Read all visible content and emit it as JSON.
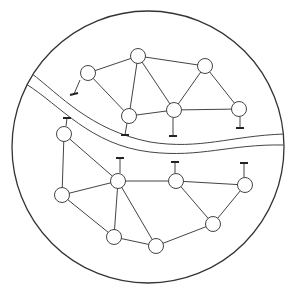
{
  "diagram": {
    "title": "",
    "colors": {
      "stroke": "#444444",
      "background": "#ffffff",
      "node_fill": "#ffffff"
    },
    "boundary": {
      "cx": 148,
      "cy": 147,
      "r": 136
    },
    "river": {
      "upper_bank": "M 31 73 C 60 95, 90 130, 150 142 C 200 150, 230 136, 284 134",
      "lower_bank": "M 26 84 C 60 105, 90 145, 150 152 C 200 158, 230 144, 283 145"
    },
    "node_radius": 7.5,
    "nodes": [
      {
        "id": "A",
        "x": 88,
        "y": 73,
        "cluster": "north",
        "stub": "down-left"
      },
      {
        "id": "B",
        "x": 138,
        "y": 56,
        "cluster": "north",
        "stub": "none"
      },
      {
        "id": "C",
        "x": 205,
        "y": 66,
        "cluster": "north",
        "stub": "none"
      },
      {
        "id": "D",
        "x": 129,
        "y": 116,
        "cluster": "north",
        "stub": "down"
      },
      {
        "id": "E",
        "x": 174,
        "y": 110,
        "cluster": "north",
        "stub": "down"
      },
      {
        "id": "F",
        "x": 239,
        "y": 109,
        "cluster": "north",
        "stub": "down"
      },
      {
        "id": "G",
        "x": 64,
        "y": 134,
        "cluster": "south",
        "stub": "up"
      },
      {
        "id": "H",
        "x": 62,
        "y": 195,
        "cluster": "south",
        "stub": "none"
      },
      {
        "id": "I",
        "x": 118,
        "y": 181,
        "cluster": "south",
        "stub": "up"
      },
      {
        "id": "J",
        "x": 176,
        "y": 181,
        "cluster": "south",
        "stub": "up"
      },
      {
        "id": "K",
        "x": 245,
        "y": 185,
        "cluster": "south",
        "stub": "up"
      },
      {
        "id": "M",
        "x": 114,
        "y": 237,
        "cluster": "south",
        "stub": "none"
      },
      {
        "id": "L",
        "x": 156,
        "y": 246,
        "cluster": "south",
        "stub": "none"
      },
      {
        "id": "N",
        "x": 213,
        "y": 224,
        "cluster": "south",
        "stub": "none"
      }
    ],
    "edges": [
      [
        "A",
        "B"
      ],
      [
        "A",
        "D"
      ],
      [
        "B",
        "D"
      ],
      [
        "B",
        "E"
      ],
      [
        "B",
        "C"
      ],
      [
        "D",
        "E"
      ],
      [
        "E",
        "C"
      ],
      [
        "C",
        "F"
      ],
      [
        "E",
        "F"
      ],
      [
        "G",
        "H"
      ],
      [
        "G",
        "I"
      ],
      [
        "H",
        "I"
      ],
      [
        "H",
        "M"
      ],
      [
        "I",
        "M"
      ],
      [
        "I",
        "L"
      ],
      [
        "I",
        "J"
      ],
      [
        "M",
        "L"
      ],
      [
        "J",
        "K"
      ],
      [
        "J",
        "N"
      ],
      [
        "K",
        "N"
      ],
      [
        "L",
        "N"
      ]
    ],
    "stubs": [
      {
        "node": "A",
        "x1": 80,
        "y1": 80,
        "x2": 74,
        "y2": 94,
        "bar": [
          70,
          95,
          78,
          93
        ]
      },
      {
        "node": "D",
        "x1": 127,
        "y1": 123,
        "x2": 125,
        "y2": 135,
        "bar": [
          121,
          135,
          129,
          135
        ]
      },
      {
        "node": "E",
        "x1": 173,
        "y1": 118,
        "x2": 173,
        "y2": 136,
        "bar": [
          169,
          136,
          177,
          136
        ]
      },
      {
        "node": "F",
        "x1": 240,
        "y1": 117,
        "x2": 240,
        "y2": 128,
        "bar": [
          236,
          128,
          244,
          128
        ]
      },
      {
        "node": "G",
        "x1": 66,
        "y1": 126,
        "x2": 67,
        "y2": 118,
        "bar": [
          63,
          118,
          71,
          118
        ]
      },
      {
        "node": "I",
        "x1": 120,
        "y1": 173,
        "x2": 120,
        "y2": 158,
        "bar": [
          116,
          158,
          124,
          158
        ]
      },
      {
        "node": "J",
        "x1": 175,
        "y1": 173,
        "x2": 175,
        "y2": 162,
        "bar": [
          171,
          162,
          179,
          162
        ]
      },
      {
        "node": "K",
        "x1": 244,
        "y1": 177,
        "x2": 244,
        "y2": 163,
        "bar": [
          240,
          163,
          248,
          163
        ]
      }
    ]
  }
}
